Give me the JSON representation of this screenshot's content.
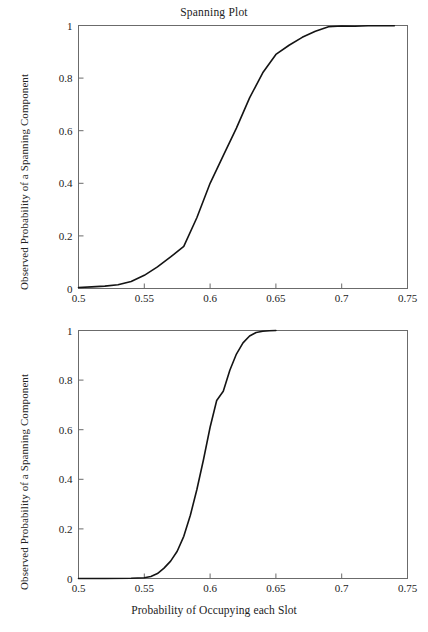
{
  "figure": {
    "background_color": "#ffffff",
    "line_color": "#141414",
    "axis_color": "#6b6b6b",
    "text_color": "#222222"
  },
  "chart_data": [
    {
      "type": "line",
      "id": "top",
      "title": "Spanning Plot",
      "xlabel": "",
      "ylabel": "Observed Probability of a Spanning Component",
      "xlim": [
        0.5,
        0.75
      ],
      "ylim": [
        0,
        1
      ],
      "xticks": [
        0.5,
        0.55,
        0.6,
        0.65,
        0.7,
        0.75
      ],
      "xticklabels": [
        "0.5",
        "0.55",
        "0.6",
        "0.65",
        "0.7",
        "0.75"
      ],
      "yticks": [
        0,
        0.2,
        0.4,
        0.6,
        0.8,
        1
      ],
      "yticklabels": [
        "0",
        "0.2",
        "0.4",
        "0.6",
        "0.8",
        "1"
      ],
      "grid": false,
      "legend": "none",
      "series": [
        {
          "name": "observed spanning probability",
          "x": [
            0.5,
            0.51,
            0.52,
            0.53,
            0.54,
            0.55,
            0.56,
            0.57,
            0.58,
            0.59,
            0.6,
            0.61,
            0.62,
            0.63,
            0.64,
            0.65,
            0.66,
            0.67,
            0.68,
            0.69,
            0.7,
            0.71,
            0.72,
            0.73,
            0.74
          ],
          "y": [
            0.004,
            0.006,
            0.009,
            0.014,
            0.027,
            0.05,
            0.082,
            0.12,
            0.16,
            0.27,
            0.4,
            0.505,
            0.61,
            0.725,
            0.82,
            0.89,
            0.925,
            0.955,
            0.978,
            0.995,
            0.998,
            0.997,
            0.999,
            0.999,
            0.999
          ]
        }
      ]
    },
    {
      "type": "line",
      "id": "bottom",
      "title": "",
      "xlabel": "Probability of Occupying each Slot",
      "ylabel": "Observed Probability of a Spanning Component",
      "xlim": [
        0.5,
        0.75
      ],
      "ylim": [
        0,
        1
      ],
      "xticks": [
        0.5,
        0.55,
        0.6,
        0.65,
        0.7,
        0.75
      ],
      "xticklabels": [
        "0.5",
        "0.55",
        "0.6",
        "0.65",
        "0.7",
        "0.75"
      ],
      "yticks": [
        0,
        0.2,
        0.4,
        0.6,
        0.8,
        1
      ],
      "yticklabels": [
        "0",
        "0.2",
        "0.4",
        "0.6",
        "0.8",
        "1"
      ],
      "grid": false,
      "legend": "none",
      "series": [
        {
          "name": "observed spanning probability",
          "x": [
            0.5,
            0.52,
            0.54,
            0.55,
            0.555,
            0.56,
            0.565,
            0.57,
            0.575,
            0.58,
            0.585,
            0.59,
            0.595,
            0.6,
            0.605,
            0.61,
            0.615,
            0.62,
            0.625,
            0.63,
            0.635,
            0.64,
            0.645,
            0.65
          ],
          "y": [
            0.0,
            0.0,
            0.001,
            0.003,
            0.008,
            0.02,
            0.042,
            0.07,
            0.11,
            0.17,
            0.255,
            0.36,
            0.48,
            0.61,
            0.718,
            0.755,
            0.84,
            0.905,
            0.95,
            0.978,
            0.992,
            0.997,
            0.999,
            1.0
          ]
        }
      ]
    }
  ]
}
